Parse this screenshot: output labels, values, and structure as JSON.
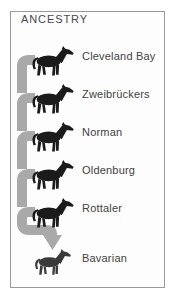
{
  "panel": {
    "title": "ANCESTRY"
  },
  "breeds": [
    {
      "label": "Cleveland Bay"
    },
    {
      "label": "Zweibrückers"
    },
    {
      "label": "Norman"
    },
    {
      "label": "Oldenburg"
    },
    {
      "label": "Rottaler"
    },
    {
      "label": "Bavarian"
    }
  ],
  "icons": {
    "horse": "horse-silhouette-icon",
    "arrow": "down-arrow-icon"
  },
  "colors": {
    "connector": "#a9a9a9",
    "horse": "#1b1b1b",
    "horse_final": "#3a3a3a",
    "text": "#424242",
    "title": "#4a4a4a",
    "border": "#9a9a9a",
    "background": "#ffffff"
  }
}
